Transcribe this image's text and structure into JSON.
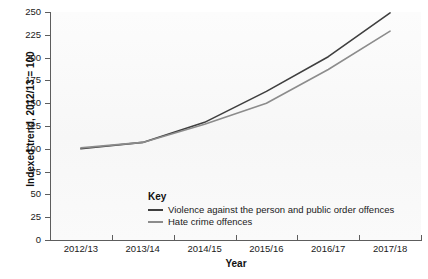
{
  "chart_data": {
    "type": "line",
    "title": "",
    "xlabel": "Year",
    "ylabel": "Indexed trend, 2012/13 = 100",
    "categories": [
      "2012/13",
      "2013/14",
      "2014/15",
      "2015/16",
      "2016/17",
      "2017/18"
    ],
    "ylim": [
      0,
      250
    ],
    "yticks": [
      0,
      25,
      50,
      75,
      100,
      125,
      150,
      175,
      200,
      225,
      250
    ],
    "ytick_labels": [
      "0",
      "25",
      "50",
      "75",
      "100",
      "125",
      "150",
      "175",
      "200",
      "225",
      "250"
    ],
    "grid": false,
    "legend_position": "inside-bottom-left",
    "legend_title": "Key",
    "series": [
      {
        "name": "Violence against the person and public order offences",
        "color": "#3f3f3f",
        "values": [
          100,
          107,
          129,
          163,
          201,
          249
        ]
      },
      {
        "name": "Hate crime offences",
        "color": "#8c8c8c",
        "values": [
          101,
          107,
          127,
          150,
          187,
          229
        ]
      }
    ]
  }
}
